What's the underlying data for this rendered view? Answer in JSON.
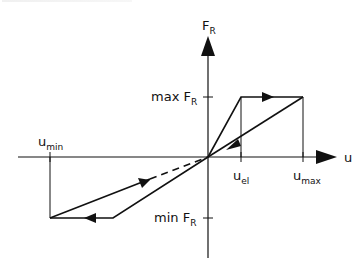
{
  "diagram": {
    "title_fragment": "",
    "axes": {
      "y_label": "F",
      "y_label_sub": "R",
      "x_label": "u"
    },
    "ticks": {
      "max_force": {
        "main": "max F",
        "sub": "R"
      },
      "min_force": {
        "main": "min F",
        "sub": "R"
      },
      "u_el": {
        "main": "u",
        "sub": "el"
      },
      "u_max": {
        "main": "u",
        "sub": "max"
      },
      "u_min": {
        "main": "u",
        "sub": "min"
      }
    },
    "colors": {
      "line": "#111111",
      "background": "#ffffff"
    }
  }
}
